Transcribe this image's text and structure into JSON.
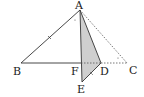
{
  "diagram": {
    "type": "geometry-figure",
    "points": {
      "A": {
        "label": "A",
        "x": 80,
        "y": 10
      },
      "B": {
        "label": "B",
        "x": 21,
        "y": 63
      },
      "F": {
        "label": "F",
        "x": 81,
        "y": 63
      },
      "D": {
        "label": "D",
        "x": 101,
        "y": 63
      },
      "C": {
        "label": "C",
        "x": 127,
        "y": 63
      },
      "E": {
        "label": "E",
        "x": 82,
        "y": 82
      }
    },
    "solid_segments": [
      "AB",
      "BD",
      "AD",
      "AE",
      "DE"
    ],
    "dashed_segments": [
      "AC",
      "DC",
      "FD"
    ],
    "shaded_region": "triangle ADE",
    "colors": {
      "line": "#333333",
      "shade": "#c8c8c8",
      "dash": "#555555"
    }
  }
}
